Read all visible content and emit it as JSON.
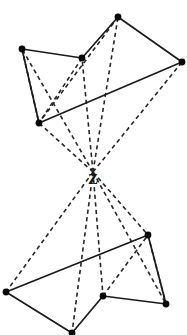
{
  "diagram": {
    "type": "line-diagram",
    "width": 187,
    "height": 335,
    "background_color": "#ffffff",
    "line_color": "#1a1a1a",
    "vertex_color": "#080808",
    "apex": {
      "label": "Z",
      "name": "projection-center-z",
      "x": 93,
      "y": 181,
      "converge_x": 93,
      "converge_y": 172
    },
    "upper_figure": {
      "name": "upper-polygon",
      "vertices": [
        {
          "id": "u1",
          "label": "",
          "x": 22,
          "y": 49
        },
        {
          "id": "u2",
          "label": "",
          "x": 82,
          "y": 58
        },
        {
          "id": "u3",
          "label": "",
          "x": 118,
          "y": 17
        },
        {
          "id": "u4",
          "label": "",
          "x": 182,
          "y": 62
        },
        {
          "id": "u5",
          "label": "",
          "x": 39,
          "y": 123
        }
      ],
      "solid_edges": [
        {
          "from": "u1",
          "to": "u2"
        },
        {
          "from": "u2",
          "to": "u3"
        },
        {
          "from": "u3",
          "to": "u4"
        },
        {
          "from": "u4",
          "to": "u5"
        },
        {
          "from": "u5",
          "to": "u1"
        }
      ],
      "dashed_edges": [
        {
          "from": "u1",
          "to": "u5"
        },
        {
          "from": "u2",
          "to": "u5"
        },
        {
          "from": "u3",
          "to": "u5"
        }
      ]
    },
    "lower_figure": {
      "name": "lower-polygon",
      "vertices": [
        {
          "id": "l1",
          "label": "",
          "x": 6,
          "y": 292
        },
        {
          "id": "l2",
          "label": "",
          "x": 72,
          "y": 333
        },
        {
          "id": "l3",
          "label": "",
          "x": 103,
          "y": 296
        },
        {
          "id": "l4",
          "label": "",
          "x": 166,
          "y": 304
        },
        {
          "id": "l5",
          "label": "",
          "x": 148,
          "y": 235
        }
      ],
      "solid_edges": [
        {
          "from": "l1",
          "to": "l5"
        },
        {
          "from": "l1",
          "to": "l2"
        },
        {
          "from": "l2",
          "to": "l3"
        },
        {
          "from": "l3",
          "to": "l4"
        },
        {
          "from": "l5",
          "to": "l4"
        }
      ],
      "dashed_edges": [
        {
          "from": "l5",
          "to": "l4"
        },
        {
          "from": "l3",
          "to": "l5"
        }
      ]
    },
    "projection_rays_upper": [
      {
        "name": "ray-z-to-u1",
        "to": "u1"
      },
      {
        "name": "ray-z-to-u2",
        "to": "u2"
      },
      {
        "name": "ray-z-to-u3",
        "to": "u3"
      },
      {
        "name": "ray-z-to-u4",
        "to": "u4"
      },
      {
        "name": "ray-z-to-u5",
        "to": "u5"
      }
    ],
    "projection_rays_lower": [
      {
        "name": "ray-z-to-l1",
        "to": "l1"
      },
      {
        "name": "ray-z-to-l2",
        "to": "l2"
      },
      {
        "name": "ray-z-to-l3",
        "to": "l3"
      },
      {
        "name": "ray-z-to-l4",
        "to": "l4"
      },
      {
        "name": "ray-z-to-l5",
        "to": "l5"
      }
    ]
  }
}
